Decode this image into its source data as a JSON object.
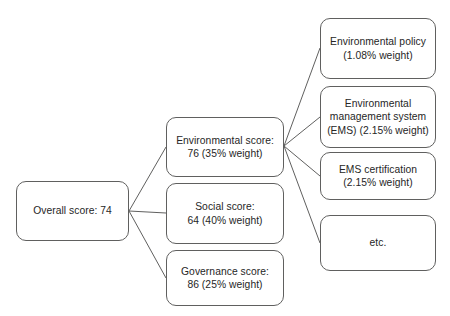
{
  "diagram": {
    "type": "tree-diagram",
    "stroke_color": "#60605f",
    "text_color": "#262626",
    "background_color": "#ffffff",
    "nodes": {
      "overall": {
        "label": "Overall score: 74",
        "score": 74,
        "level": 1
      },
      "environmental": {
        "label": "Environmental score:\n76 (35% weight)",
        "score": 76,
        "weight": "35%",
        "level": 2
      },
      "social": {
        "label": "Social score:\n64 (40% weight)",
        "score": 64,
        "weight": "40%",
        "level": 2
      },
      "governance": {
        "label": "Governance score:\n86 (25% weight)",
        "score": 86,
        "weight": "25%",
        "level": 2
      },
      "policy": {
        "label": "Environmental policy\n(1.08% weight)",
        "weight": "1.08%",
        "level": 3
      },
      "ems": {
        "label": "Environmental\nmanagement system\n(EMS) (2.15% weight)",
        "weight": "2.15%",
        "level": 3
      },
      "ems_certification": {
        "label": "EMS certification\n(2.15% weight)",
        "weight": "2.15%",
        "level": 3
      },
      "etc": {
        "label": "etc.",
        "level": 3
      }
    },
    "edges": [
      {
        "from": "overall",
        "to": "environmental"
      },
      {
        "from": "overall",
        "to": "social"
      },
      {
        "from": "overall",
        "to": "governance"
      },
      {
        "from": "environmental",
        "to": "policy"
      },
      {
        "from": "environmental",
        "to": "ems"
      },
      {
        "from": "environmental",
        "to": "ems_certification"
      },
      {
        "from": "environmental",
        "to": "etc"
      }
    ]
  }
}
